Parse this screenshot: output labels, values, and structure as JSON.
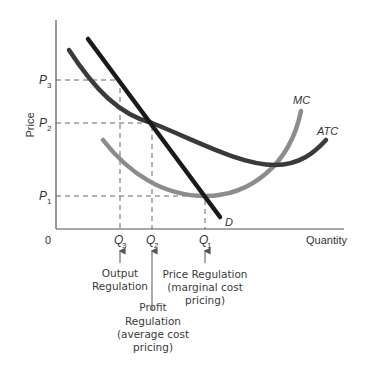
{
  "diagram": {
    "axes": {
      "y_label": "Price",
      "x_label": "Quantity",
      "origin_label": "0"
    },
    "price_levels": [
      {
        "id": "P3",
        "base": "P",
        "sub": "3"
      },
      {
        "id": "P2",
        "base": "P",
        "sub": "2"
      },
      {
        "id": "P1",
        "base": "P",
        "sub": "1"
      }
    ],
    "quantity_levels": [
      {
        "id": "Q3",
        "base": "Q",
        "sub": "3"
      },
      {
        "id": "Q2",
        "base": "Q",
        "sub": "2"
      },
      {
        "id": "Q1",
        "base": "Q",
        "sub": "1"
      }
    ],
    "curves": {
      "demand": {
        "label": "D",
        "color": "#1a1a1a"
      },
      "atc": {
        "label": "ATC",
        "color": "#3a3a3a"
      },
      "mc": {
        "label": "MC",
        "color": "#8c8c8c"
      }
    },
    "annotations": {
      "output": [
        "Output",
        "Regulation"
      ],
      "profit": [
        "Profit",
        "Regulation",
        "(average cost",
        "pricing)"
      ],
      "price": [
        "Price Regulation",
        "(marginal cost",
        "pricing)"
      ]
    }
  }
}
